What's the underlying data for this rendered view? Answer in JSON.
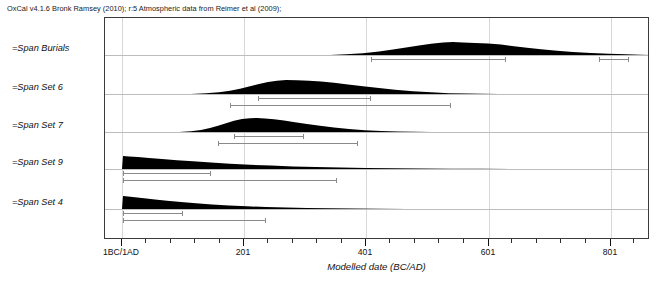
{
  "header": {
    "credit": "OxCal v4.1.6 Bronk Ramsey (2010); r:5 Atmospheric data from Reimer et al (2009);"
  },
  "caption": {
    "fragment": ""
  },
  "axis": {
    "title": "Modelled date (BC/AD)",
    "major_ticks": [
      {
        "label": "1BC/1AD",
        "value": 1,
        "x": 121
      },
      {
        "label": "201",
        "value": 201,
        "x": 243
      },
      {
        "label": "401",
        "value": 401,
        "x": 365
      },
      {
        "label": "601",
        "value": 601,
        "x": 488
      },
      {
        "label": "801",
        "value": 801,
        "x": 610
      }
    ],
    "minor_tick_spacing_px": 24.4,
    "pixels_per_200_years": 122,
    "origin_px": 121
  },
  "chart_data": {
    "type": "area",
    "xlabel": "Modelled date (BC/AD)",
    "ylabel": "",
    "xlim": [
      -138,
      965
    ],
    "grid": true,
    "legend": "none",
    "series": [
      {
        "name": "=Span Burials",
        "baseline_y": 54,
        "peak_height_px": 13,
        "distribution": [
          {
            "x": 329,
            "h": 0.0
          },
          {
            "x": 345,
            "h": 0.06
          },
          {
            "x": 362,
            "h": 0.14
          },
          {
            "x": 378,
            "h": 0.26
          },
          {
            "x": 392,
            "h": 0.42
          },
          {
            "x": 405,
            "h": 0.58
          },
          {
            "x": 418,
            "h": 0.74
          },
          {
            "x": 430,
            "h": 0.86
          },
          {
            "x": 442,
            "h": 0.96
          },
          {
            "x": 452,
            "h": 1.0
          },
          {
            "x": 462,
            "h": 0.97
          },
          {
            "x": 474,
            "h": 0.93
          },
          {
            "x": 487,
            "h": 0.88
          },
          {
            "x": 500,
            "h": 0.8
          },
          {
            "x": 513,
            "h": 0.68
          },
          {
            "x": 526,
            "h": 0.55
          },
          {
            "x": 540,
            "h": 0.44
          },
          {
            "x": 556,
            "h": 0.33
          },
          {
            "x": 572,
            "h": 0.24
          },
          {
            "x": 590,
            "h": 0.16
          },
          {
            "x": 608,
            "h": 0.1
          },
          {
            "x": 625,
            "h": 0.05
          },
          {
            "x": 640,
            "h": 0.02
          },
          {
            "x": 649,
            "h": 0.0
          }
        ],
        "ranges": [
          {
            "confidence": "68.2%",
            "level": 1,
            "x_start": 370,
            "x_end": 505
          },
          {
            "confidence": "68.2%",
            "level": 1,
            "x_start": 598,
            "x_end": 628
          }
        ]
      },
      {
        "name": "=Span Set 6",
        "baseline_y": 93,
        "peak_height_px": 14,
        "distribution": [
          {
            "x": 190,
            "h": 0.0
          },
          {
            "x": 205,
            "h": 0.05
          },
          {
            "x": 218,
            "h": 0.13
          },
          {
            "x": 229,
            "h": 0.24
          },
          {
            "x": 239,
            "h": 0.38
          },
          {
            "x": 249,
            "h": 0.55
          },
          {
            "x": 258,
            "h": 0.72
          },
          {
            "x": 267,
            "h": 0.86
          },
          {
            "x": 276,
            "h": 0.95
          },
          {
            "x": 285,
            "h": 1.0
          },
          {
            "x": 296,
            "h": 0.99
          },
          {
            "x": 308,
            "h": 0.95
          },
          {
            "x": 320,
            "h": 0.89
          },
          {
            "x": 333,
            "h": 0.8
          },
          {
            "x": 347,
            "h": 0.68
          },
          {
            "x": 362,
            "h": 0.55
          },
          {
            "x": 378,
            "h": 0.42
          },
          {
            "x": 394,
            "h": 0.3
          },
          {
            "x": 412,
            "h": 0.2
          },
          {
            "x": 430,
            "h": 0.12
          },
          {
            "x": 448,
            "h": 0.06
          },
          {
            "x": 466,
            "h": 0.03
          },
          {
            "x": 482,
            "h": 0.01
          },
          {
            "x": 498,
            "h": 0.0
          }
        ],
        "ranges": [
          {
            "confidence": "68.2%",
            "level": 1,
            "x_start": 257,
            "x_end": 370
          },
          {
            "confidence": "95.4%",
            "level": 2,
            "x_start": 229,
            "x_end": 450
          }
        ]
      },
      {
        "name": "=Span Set 7",
        "baseline_y": 131,
        "peak_height_px": 14,
        "distribution": [
          {
            "x": 178,
            "h": 0.0
          },
          {
            "x": 190,
            "h": 0.06
          },
          {
            "x": 200,
            "h": 0.15
          },
          {
            "x": 209,
            "h": 0.28
          },
          {
            "x": 217,
            "h": 0.45
          },
          {
            "x": 225,
            "h": 0.63
          },
          {
            "x": 233,
            "h": 0.8
          },
          {
            "x": 241,
            "h": 0.92
          },
          {
            "x": 249,
            "h": 0.99
          },
          {
            "x": 256,
            "h": 1.0
          },
          {
            "x": 264,
            "h": 0.97
          },
          {
            "x": 273,
            "h": 0.91
          },
          {
            "x": 283,
            "h": 0.82
          },
          {
            "x": 294,
            "h": 0.7
          },
          {
            "x": 306,
            "h": 0.57
          },
          {
            "x": 319,
            "h": 0.44
          },
          {
            "x": 333,
            "h": 0.32
          },
          {
            "x": 348,
            "h": 0.21
          },
          {
            "x": 364,
            "h": 0.13
          },
          {
            "x": 380,
            "h": 0.07
          },
          {
            "x": 397,
            "h": 0.03
          },
          {
            "x": 414,
            "h": 0.01
          },
          {
            "x": 430,
            "h": 0.0
          }
        ],
        "ranges": [
          {
            "confidence": "68.2%",
            "level": 1,
            "x_start": 233,
            "x_end": 303
          },
          {
            "confidence": "95.4%",
            "level": 2,
            "x_start": 217,
            "x_end": 357
          }
        ]
      },
      {
        "name": "=Span Set 9",
        "baseline_y": 168,
        "peak_height_px": 13,
        "distribution": [
          {
            "x": 121,
            "h": 0.0
          },
          {
            "x": 122,
            "h": 1.0
          },
          {
            "x": 128,
            "h": 0.97
          },
          {
            "x": 137,
            "h": 0.92
          },
          {
            "x": 148,
            "h": 0.85
          },
          {
            "x": 161,
            "h": 0.77
          },
          {
            "x": 176,
            "h": 0.68
          },
          {
            "x": 192,
            "h": 0.59
          },
          {
            "x": 210,
            "h": 0.5
          },
          {
            "x": 229,
            "h": 0.41
          },
          {
            "x": 249,
            "h": 0.33
          },
          {
            "x": 270,
            "h": 0.26
          },
          {
            "x": 292,
            "h": 0.2
          },
          {
            "x": 315,
            "h": 0.15
          },
          {
            "x": 339,
            "h": 0.11
          },
          {
            "x": 365,
            "h": 0.08
          },
          {
            "x": 392,
            "h": 0.05
          },
          {
            "x": 420,
            "h": 0.03
          },
          {
            "x": 450,
            "h": 0.02
          },
          {
            "x": 482,
            "h": 0.01
          },
          {
            "x": 520,
            "h": 0.0
          }
        ],
        "ranges": [
          {
            "confidence": "68.2%",
            "level": 1,
            "x_start": 122,
            "x_end": 210
          },
          {
            "confidence": "95.4%",
            "level": 2,
            "x_start": 122,
            "x_end": 336
          }
        ]
      },
      {
        "name": "=Span Set 4",
        "baseline_y": 208,
        "peak_height_px": 13,
        "distribution": [
          {
            "x": 121,
            "h": 0.0
          },
          {
            "x": 122,
            "h": 1.0
          },
          {
            "x": 127,
            "h": 0.96
          },
          {
            "x": 134,
            "h": 0.9
          },
          {
            "x": 143,
            "h": 0.82
          },
          {
            "x": 154,
            "h": 0.73
          },
          {
            "x": 166,
            "h": 0.63
          },
          {
            "x": 180,
            "h": 0.53
          },
          {
            "x": 195,
            "h": 0.44
          },
          {
            "x": 211,
            "h": 0.35
          },
          {
            "x": 228,
            "h": 0.27
          },
          {
            "x": 246,
            "h": 0.21
          },
          {
            "x": 265,
            "h": 0.15
          },
          {
            "x": 285,
            "h": 0.11
          },
          {
            "x": 306,
            "h": 0.07
          },
          {
            "x": 328,
            "h": 0.05
          },
          {
            "x": 352,
            "h": 0.03
          },
          {
            "x": 378,
            "h": 0.01
          },
          {
            "x": 405,
            "h": 0.0
          }
        ],
        "ranges": [
          {
            "confidence": "68.2%",
            "level": 1,
            "x_start": 122,
            "x_end": 182
          },
          {
            "confidence": "95.4%",
            "level": 2,
            "x_start": 122,
            "x_end": 265
          }
        ]
      }
    ]
  }
}
